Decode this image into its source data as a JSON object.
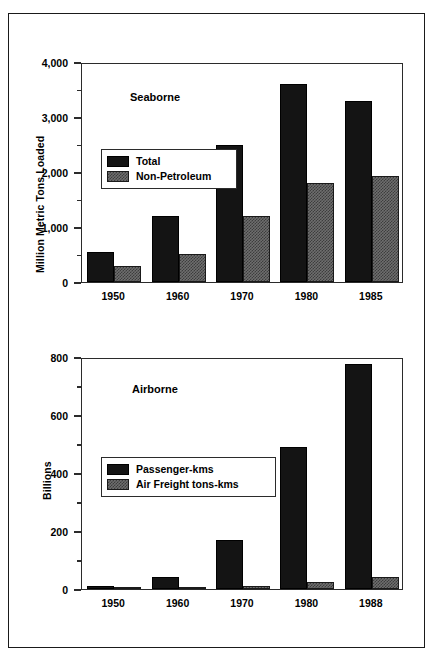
{
  "chart_data": [
    {
      "type": "bar",
      "title": "Seaborne",
      "ylabel": "Million Metric Tons Loaded",
      "xlabel": "",
      "categories": [
        "1950",
        "1960",
        "1970",
        "1980",
        "1985"
      ],
      "ylim": [
        0,
        4000
      ],
      "yticks": [
        0,
        1000,
        2000,
        3000,
        4000
      ],
      "ytick_labels": [
        "0",
        "1,000",
        "2,000",
        "3,000",
        "4,000"
      ],
      "yminor_ticks": [
        500,
        1500,
        2500,
        3500
      ],
      "grid": false,
      "legend_position": "upper-left-inside",
      "series": [
        {
          "name": "Total",
          "values": [
            550,
            1200,
            2500,
            3600,
            3300
          ],
          "color": "#141414",
          "fill": "solid"
        },
        {
          "name": "Non-Petroleum",
          "values": [
            300,
            510,
            1200,
            1800,
            1930
          ],
          "color": "#6e6e6e",
          "fill": "checker"
        }
      ]
    },
    {
      "type": "bar",
      "title": "Airborne",
      "ylabel": "Billions",
      "xlabel": "",
      "categories": [
        "1950",
        "1960",
        "1970",
        "1980",
        "1988"
      ],
      "ylim": [
        0,
        800
      ],
      "yticks": [
        0,
        200,
        400,
        600,
        800
      ],
      "ytick_labels": [
        "0",
        "200",
        "400",
        "600",
        "800"
      ],
      "yminor_ticks": [
        100,
        300,
        500,
        700
      ],
      "grid": false,
      "legend_position": "mid-left-inside",
      "series": [
        {
          "name": "Passenger-kms",
          "values": [
            10,
            43,
            170,
            490,
            775
          ],
          "color": "#141414",
          "fill": "solid"
        },
        {
          "name": "Air Freight tons-kms",
          "values": [
            1,
            2,
            10,
            24,
            40
          ],
          "color": "#6e6e6e",
          "fill": "checker"
        }
      ]
    }
  ]
}
